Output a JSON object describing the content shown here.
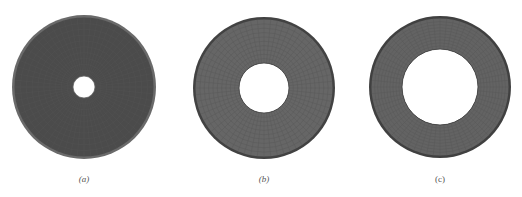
{
  "figure": {
    "panels": [
      {
        "id": "a",
        "label": "(a)",
        "italic": true,
        "cx": 84,
        "cy": 87,
        "outer_r": 72,
        "inner_r": 11,
        "fill": "#4b4b4b",
        "rim": "#6a6a6a"
      },
      {
        "id": "b",
        "label": "(b)",
        "italic": true,
        "cx": 264,
        "cy": 88,
        "outer_r": 71,
        "inner_r": 25,
        "fill": "#666666",
        "rim": "#424242"
      },
      {
        "id": "c",
        "label": "(c)",
        "italic": false,
        "cx": 440,
        "cy": 87,
        "outer_r": 71,
        "inner_r": 38,
        "fill": "#636363",
        "rim": "#404040"
      }
    ],
    "mesh_color": "#555555",
    "background": "#ffffff"
  }
}
